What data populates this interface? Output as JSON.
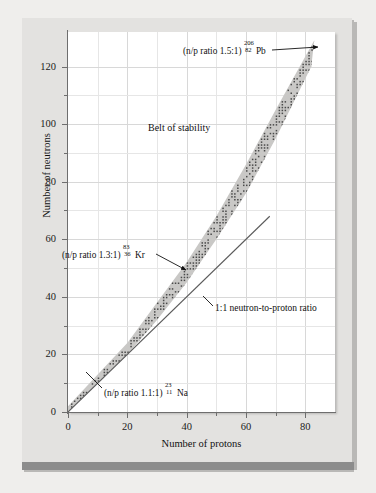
{
  "figure": {
    "kind": "belt-of-stability-plot"
  },
  "chart_data": {
    "type": "scatter",
    "title": "",
    "xlabel": "Number of protons",
    "ylabel": "Number of neutrons",
    "xlim": [
      0,
      90
    ],
    "ylim": [
      0,
      132
    ],
    "xticks": [
      0,
      20,
      40,
      60,
      80
    ],
    "yticks": [
      0,
      20,
      40,
      60,
      80,
      100,
      120
    ],
    "xticks_minor": [
      10,
      30,
      50,
      70
    ],
    "yticks_minor": [
      10,
      30,
      50,
      70,
      90,
      110
    ],
    "grid": true,
    "legend": "none",
    "series": [
      {
        "name": "Belt of stability",
        "type": "band",
        "description": "Shaded band of stable nuclides dotted with individual nuclide markers",
        "lower_bound": [
          [
            0,
            0
          ],
          [
            10,
            10
          ],
          [
            20,
            20
          ],
          [
            30,
            32
          ],
          [
            40,
            45
          ],
          [
            50,
            60
          ],
          [
            60,
            76
          ],
          [
            70,
            95
          ],
          [
            82,
            120
          ]
        ],
        "upper_bound": [
          [
            0,
            2
          ],
          [
            10,
            13
          ],
          [
            20,
            24
          ],
          [
            30,
            38
          ],
          [
            40,
            52
          ],
          [
            50,
            68
          ],
          [
            60,
            86
          ],
          [
            70,
            105
          ],
          [
            83,
            129
          ]
        ]
      },
      {
        "name": "1:1 neutron-to-proton ratio",
        "type": "line",
        "x": [
          0,
          68
        ],
        "y": [
          0,
          68
        ]
      }
    ],
    "annotations": [
      {
        "name": "belt-of-stability-label",
        "text": "Belt of stability",
        "x": 30,
        "y": 98
      },
      {
        "name": "lead-206-label",
        "prefix": "(n/p ratio 1.5:1) ",
        "mass_number": "206",
        "atomic_number": "82",
        "symbol": "Pb",
        "ratio": "1.5:1",
        "x": 82,
        "y": 124
      },
      {
        "name": "krypton-83-label",
        "prefix": "(n/p ratio 1.3:1)",
        "mass_number": "83",
        "atomic_number": "36",
        "symbol": "Kr",
        "ratio": "1.3:1",
        "x": 36,
        "y": 47
      },
      {
        "name": "sodium-23-label",
        "prefix": "(n/p ratio 1.1:1)",
        "mass_number": "23",
        "atomic_number": "11",
        "symbol": "Na",
        "ratio": "1.1:1",
        "x": 11,
        "y": 12
      },
      {
        "name": "one-to-one-ratio-label",
        "text": "1:1 neutron-to-proton ratio",
        "x": 52,
        "y": 42
      }
    ]
  },
  "axes": {
    "x_title": "Number of protons",
    "y_title": "Number of neutrons",
    "x_tick_labels": [
      "0",
      "20",
      "40",
      "60",
      "80"
    ],
    "y_tick_labels": [
      "0",
      "20",
      "40",
      "60",
      "80",
      "100",
      "120"
    ]
  },
  "labels": {
    "belt": "Belt of stability",
    "ratio_11_line": "1:1 neutron-to-proton ratio",
    "pb_prefix": "(n/p ratio 1.5:1)",
    "pb_mass": "206",
    "pb_number": "82",
    "pb_symbol": "Pb",
    "kr_prefix": "(n/p ratio 1.3:1)",
    "kr_mass": "83",
    "kr_number": "36",
    "kr_symbol": "Kr",
    "na_prefix": "(n/p ratio 1.1:1)",
    "na_mass": "23",
    "na_number": "11",
    "na_symbol": "Na"
  },
  "colors": {
    "page": "#efeeec",
    "panel": "#e3e2e0",
    "plot_bg": "#ffffff",
    "band": "#c9c8c6",
    "grid": "#d8d8d8",
    "axis": "#6e6e6e",
    "text": "#111111",
    "bottom_bar": "#8c8c8c",
    "line": "#5a5a5a"
  }
}
